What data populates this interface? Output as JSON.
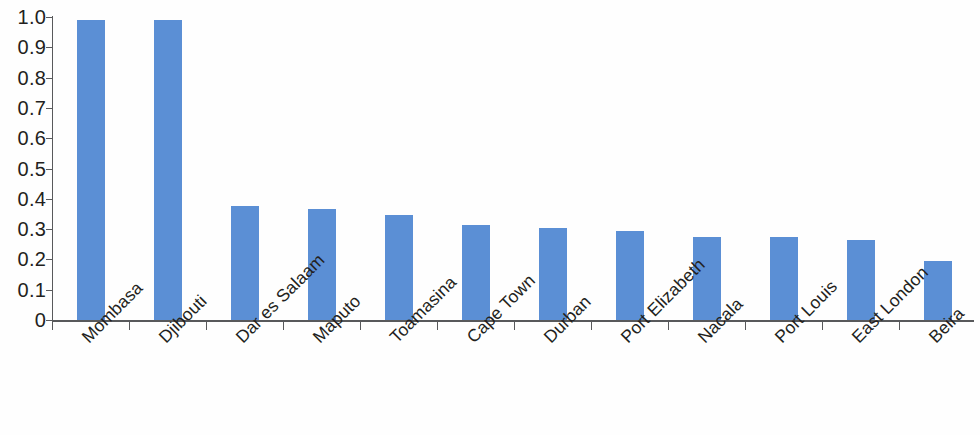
{
  "chart_data": {
    "type": "bar",
    "title": "",
    "subtitle": "",
    "xlabel": "",
    "ylabel": "",
    "categories": [
      "Mombasa",
      "Djibouti",
      "Dar es Salaam",
      "Maputo",
      "Toamasina",
      "Cape Town",
      "Durban",
      "Port Elizabeth",
      "Nacala",
      "Port Louis",
      "East London",
      "Beira"
    ],
    "values": [
      0.99,
      0.99,
      0.375,
      0.365,
      0.345,
      0.315,
      0.305,
      0.295,
      0.275,
      0.275,
      0.265,
      0.195
    ],
    "ylim": [
      0,
      1.0
    ],
    "ytick_values": [
      0,
      0.1,
      0.2,
      0.3,
      0.4,
      0.5,
      0.6,
      0.7,
      0.8,
      0.9,
      1.0
    ],
    "ytick_labels": [
      "0",
      "0.1",
      "0.2",
      "0.3",
      "0.4",
      "0.5",
      "0.6",
      "0.7",
      "0.8",
      "0.9",
      "1.0"
    ],
    "grid": false,
    "legend": null,
    "bar_color": "#5b8fd5",
    "axis_color": "#58595b",
    "text_color": "#231f20",
    "background_color": "#fefefe",
    "xtick_label_rotation": -45
  }
}
